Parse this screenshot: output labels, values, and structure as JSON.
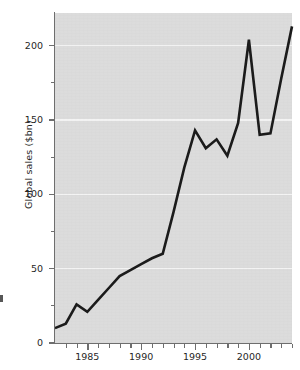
{
  "chart_data": {
    "type": "line",
    "title": "",
    "xlabel": "",
    "ylabel": "Global sales ($bn)",
    "xlim": [
      1982,
      2004
    ],
    "ylim": [
      0,
      222
    ],
    "grid": true,
    "grid_orientation": "horizontal",
    "legend": "none",
    "line_color": "#1a1a1a",
    "plot_background": "#dcdcdc",
    "gridline_color": "#f4f4f4",
    "axis_color": "#6e6e6e",
    "y_ticks_major": [
      0,
      50,
      100,
      150,
      200
    ],
    "y_ticks_minor": [
      25,
      75,
      125,
      175
    ],
    "y_tick_labels": [
      "0",
      "50",
      "100",
      "150",
      "200"
    ],
    "x_ticks_major": [
      1985,
      1990,
      1995,
      2000
    ],
    "x_tick_labels": [
      "1985",
      "1990",
      "1995",
      "2000"
    ],
    "x_ticks_minor": [
      1983,
      1984,
      1986,
      1987,
      1988,
      1989,
      1991,
      1992,
      1993,
      1994,
      1996,
      1997,
      1998,
      1999,
      2001,
      2002,
      2003,
      2004
    ],
    "x": [
      1982,
      1983,
      1984,
      1985,
      1986,
      1987,
      1988,
      1989,
      1990,
      1991,
      1992,
      1993,
      1994,
      1995,
      1996,
      1997,
      1998,
      1999,
      2000,
      2001,
      2002,
      2003,
      2004
    ],
    "values": [
      10,
      13,
      26,
      21,
      29,
      37,
      45,
      49,
      53,
      57,
      60,
      88,
      118,
      143,
      131,
      137,
      126,
      148,
      204,
      140,
      141,
      178,
      213
    ],
    "series": [
      {
        "name": "Global sales",
        "values": [
          10,
          13,
          26,
          21,
          29,
          37,
          45,
          49,
          53,
          57,
          60,
          88,
          118,
          143,
          131,
          137,
          126,
          148,
          204,
          140,
          141,
          178,
          213
        ]
      }
    ]
  }
}
